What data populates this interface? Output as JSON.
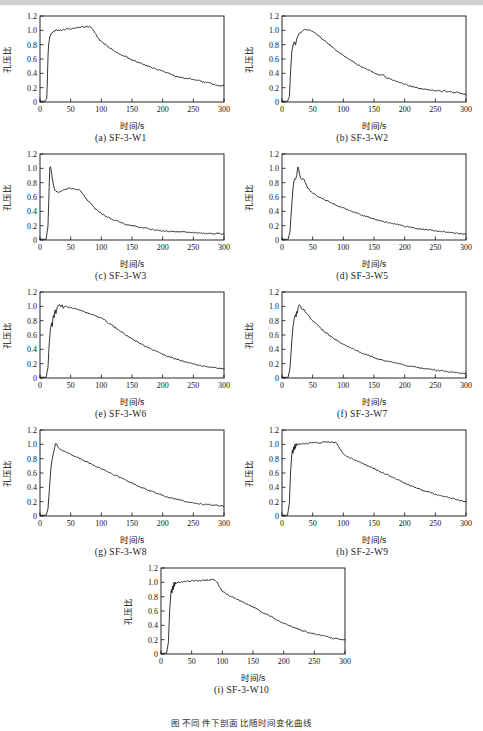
{
  "figure": {
    "caption": "图    不同       件下剖面            比随时间变化曲线",
    "axis": {
      "xlabel": "时间/s",
      "ylabel": "孔压比",
      "xticks": [
        0,
        50,
        100,
        150,
        200,
        250,
        300
      ],
      "yticks": [
        "0",
        "0.2",
        "0.4",
        "0.6",
        "0.8",
        "1.0",
        "1.2"
      ],
      "xlim": [
        0,
        300
      ],
      "ylim": [
        0,
        1.2
      ],
      "grid": false,
      "line_color": "#111111"
    }
  },
  "chart_data": [
    {
      "type": "line",
      "panel": "a",
      "title": "(a) SF-3-W1",
      "xlabel": "时间/s",
      "ylabel": "孔压比",
      "xlim": [
        0,
        300
      ],
      "ylim": [
        0,
        1.2
      ],
      "x": [
        0,
        8,
        11,
        12,
        13,
        14,
        16,
        18,
        20,
        23,
        26,
        30,
        35,
        40,
        45,
        50,
        55,
        60,
        65,
        70,
        75,
        80,
        84,
        88,
        92,
        96,
        100,
        110,
        120,
        130,
        140,
        150,
        160,
        170,
        180,
        190,
        200,
        210,
        215,
        220,
        230,
        240,
        250,
        260,
        265,
        270,
        275,
        280,
        285,
        290,
        295,
        300
      ],
      "y": [
        0.01,
        0.01,
        0.05,
        0.3,
        0.62,
        0.8,
        0.9,
        0.95,
        0.97,
        0.99,
        1.0,
        1.0,
        1.0,
        1.01,
        1.02,
        1.02,
        1.03,
        1.04,
        1.04,
        1.05,
        1.05,
        1.05,
        1.04,
        0.99,
        0.93,
        0.88,
        0.84,
        0.78,
        0.72,
        0.67,
        0.63,
        0.59,
        0.55,
        0.52,
        0.49,
        0.46,
        0.43,
        0.4,
        0.39,
        0.36,
        0.34,
        0.33,
        0.31,
        0.3,
        0.28,
        0.27,
        0.27,
        0.26,
        0.24,
        0.23,
        0.22,
        0.24
      ]
    },
    {
      "type": "line",
      "panel": "b",
      "title": "(b) SF-3-W2",
      "xlabel": "时间/s",
      "ylabel": "孔压比",
      "xlim": [
        0,
        300
      ],
      "ylim": [
        0,
        1.2
      ],
      "x": [
        0,
        9,
        12,
        14,
        16,
        18,
        20,
        22,
        24,
        26,
        28,
        30,
        34,
        38,
        42,
        46,
        50,
        55,
        60,
        70,
        80,
        90,
        100,
        110,
        120,
        130,
        140,
        150,
        160,
        165,
        170,
        180,
        190,
        200,
        210,
        220,
        230,
        240,
        250,
        260,
        265,
        270,
        275,
        280,
        285,
        290,
        295,
        300
      ],
      "y": [
        0.01,
        0.01,
        0.08,
        0.42,
        0.7,
        0.8,
        0.84,
        0.8,
        0.88,
        0.92,
        0.95,
        0.96,
        0.99,
        1.01,
        1.01,
        1.0,
        0.98,
        0.95,
        0.92,
        0.85,
        0.78,
        0.71,
        0.65,
        0.59,
        0.54,
        0.49,
        0.45,
        0.41,
        0.37,
        0.38,
        0.34,
        0.31,
        0.28,
        0.25,
        0.22,
        0.2,
        0.18,
        0.17,
        0.16,
        0.15,
        0.16,
        0.14,
        0.15,
        0.13,
        0.14,
        0.12,
        0.12,
        0.1
      ]
    },
    {
      "type": "line",
      "panel": "c",
      "title": "(c) SF-3-W3",
      "xlabel": "时间/s",
      "ylabel": "孔压比",
      "xlim": [
        0,
        300
      ],
      "ylim": [
        0,
        1.2
      ],
      "x": [
        0,
        10,
        13,
        15,
        16,
        17,
        18,
        19,
        20,
        22,
        24,
        26,
        28,
        30,
        34,
        38,
        42,
        46,
        50,
        55,
        60,
        64,
        66,
        70,
        75,
        80,
        90,
        100,
        110,
        120,
        130,
        140,
        150,
        160,
        170,
        180,
        190,
        200,
        210,
        220,
        230,
        240,
        250,
        260,
        270,
        280,
        290,
        300
      ],
      "y": [
        0.01,
        0.01,
        0.2,
        0.75,
        1.0,
        1.02,
        0.98,
        0.92,
        0.85,
        0.76,
        0.7,
        0.68,
        0.68,
        0.67,
        0.68,
        0.7,
        0.71,
        0.72,
        0.72,
        0.71,
        0.7,
        0.7,
        0.69,
        0.64,
        0.58,
        0.53,
        0.44,
        0.37,
        0.32,
        0.28,
        0.25,
        0.22,
        0.2,
        0.18,
        0.17,
        0.15,
        0.14,
        0.13,
        0.12,
        0.12,
        0.11,
        0.11,
        0.1,
        0.1,
        0.09,
        0.09,
        0.09,
        0.08
      ]
    },
    {
      "type": "line",
      "panel": "d",
      "title": "(d) SF-3-W5",
      "xlabel": "时间/s",
      "ylabel": "孔压比",
      "xlim": [
        0,
        300
      ],
      "ylim": [
        0,
        1.2
      ],
      "x": [
        0,
        10,
        13,
        16,
        18,
        20,
        22,
        24,
        25,
        26,
        27,
        28,
        30,
        32,
        34,
        36,
        38,
        40,
        42,
        45,
        50,
        55,
        60,
        65,
        70,
        80,
        90,
        100,
        110,
        120,
        130,
        140,
        150,
        160,
        170,
        180,
        190,
        200,
        210,
        220,
        230,
        240,
        250,
        260,
        270,
        280,
        290,
        300
      ],
      "y": [
        0.01,
        0.01,
        0.12,
        0.5,
        0.72,
        0.84,
        0.85,
        0.9,
        0.98,
        1.02,
        1.0,
        0.94,
        0.86,
        0.84,
        0.86,
        0.85,
        0.8,
        0.76,
        0.73,
        0.7,
        0.66,
        0.63,
        0.6,
        0.58,
        0.56,
        0.52,
        0.48,
        0.45,
        0.41,
        0.38,
        0.35,
        0.32,
        0.29,
        0.27,
        0.25,
        0.23,
        0.21,
        0.19,
        0.18,
        0.16,
        0.15,
        0.14,
        0.13,
        0.12,
        0.11,
        0.1,
        0.09,
        0.08
      ]
    },
    {
      "type": "line",
      "panel": "e",
      "title": "(e) SF-3-W6",
      "xlabel": "时间/s",
      "ylabel": "孔压比",
      "xlim": [
        0,
        300
      ],
      "ylim": [
        0,
        1.2
      ],
      "x": [
        0,
        10,
        13,
        15,
        17,
        19,
        20,
        21,
        22,
        23,
        24,
        25,
        26,
        28,
        30,
        32,
        34,
        36,
        38,
        40,
        45,
        50,
        55,
        60,
        70,
        80,
        90,
        100,
        110,
        120,
        130,
        140,
        150,
        160,
        170,
        180,
        190,
        200,
        210,
        220,
        230,
        240,
        250,
        260,
        270,
        280,
        290,
        300
      ],
      "y": [
        0.01,
        0.01,
        0.15,
        0.48,
        0.68,
        0.78,
        0.72,
        0.82,
        0.88,
        0.84,
        0.92,
        0.95,
        0.9,
        0.98,
        1.01,
        1.02,
        1.0,
        1.02,
        0.98,
        1.0,
        0.99,
        0.98,
        0.97,
        0.96,
        0.93,
        0.9,
        0.87,
        0.84,
        0.78,
        0.72,
        0.66,
        0.6,
        0.55,
        0.5,
        0.45,
        0.41,
        0.37,
        0.33,
        0.3,
        0.27,
        0.24,
        0.22,
        0.2,
        0.18,
        0.16,
        0.15,
        0.13,
        0.13
      ]
    },
    {
      "type": "line",
      "panel": "f",
      "title": "(f) SF-3-W7",
      "xlabel": "时间/s",
      "ylabel": "孔压比",
      "xlim": [
        0,
        300
      ],
      "ylim": [
        0,
        1.2
      ],
      "x": [
        0,
        10,
        13,
        16,
        18,
        20,
        22,
        23,
        24,
        25,
        26,
        27,
        28,
        30,
        32,
        34,
        36,
        38,
        40,
        45,
        50,
        55,
        60,
        65,
        70,
        80,
        90,
        100,
        110,
        120,
        130,
        140,
        150,
        160,
        170,
        180,
        190,
        200,
        210,
        220,
        230,
        240,
        250,
        260,
        270,
        280,
        290,
        300
      ],
      "y": [
        0.01,
        0.01,
        0.14,
        0.52,
        0.72,
        0.84,
        0.88,
        0.86,
        0.92,
        0.9,
        0.96,
        1.0,
        1.03,
        1.0,
        0.97,
        0.95,
        0.96,
        0.93,
        0.9,
        0.85,
        0.8,
        0.76,
        0.72,
        0.68,
        0.64,
        0.58,
        0.52,
        0.47,
        0.43,
        0.39,
        0.35,
        0.32,
        0.29,
        0.26,
        0.24,
        0.22,
        0.2,
        0.18,
        0.16,
        0.15,
        0.13,
        0.12,
        0.11,
        0.1,
        0.09,
        0.08,
        0.07,
        0.06
      ]
    },
    {
      "type": "line",
      "panel": "g",
      "title": "(g) SF-3-W8",
      "xlabel": "时间/s",
      "ylabel": "孔压比",
      "xlim": [
        0,
        300
      ],
      "ylim": [
        0,
        1.2
      ],
      "x": [
        0,
        10,
        13,
        16,
        18,
        20,
        22,
        24,
        25,
        26,
        27,
        28,
        30,
        33,
        36,
        40,
        45,
        50,
        55,
        60,
        70,
        80,
        90,
        100,
        110,
        120,
        130,
        140,
        150,
        160,
        170,
        180,
        190,
        200,
        210,
        220,
        230,
        240,
        250,
        260,
        270,
        275,
        280,
        285,
        290,
        295,
        300
      ],
      "y": [
        0.01,
        0.01,
        0.1,
        0.45,
        0.68,
        0.8,
        0.88,
        0.96,
        1.0,
        1.02,
        1.01,
        0.99,
        0.96,
        0.93,
        0.92,
        0.9,
        0.88,
        0.86,
        0.84,
        0.82,
        0.78,
        0.74,
        0.7,
        0.66,
        0.62,
        0.58,
        0.54,
        0.5,
        0.46,
        0.42,
        0.38,
        0.35,
        0.32,
        0.29,
        0.26,
        0.24,
        0.22,
        0.2,
        0.18,
        0.17,
        0.16,
        0.17,
        0.15,
        0.16,
        0.14,
        0.14,
        0.13
      ]
    },
    {
      "type": "line",
      "panel": "h",
      "title": "(h) SF-2-W9",
      "xlabel": "时间/s",
      "ylabel": "孔压比",
      "xlim": [
        0,
        300
      ],
      "ylim": [
        0,
        1.2
      ],
      "x": [
        0,
        9,
        12,
        14,
        16,
        17,
        18,
        19,
        20,
        21,
        22,
        23,
        24,
        26,
        28,
        30,
        35,
        40,
        45,
        50,
        60,
        70,
        80,
        85,
        88,
        92,
        96,
        100,
        105,
        110,
        120,
        130,
        140,
        150,
        160,
        170,
        180,
        190,
        200,
        210,
        220,
        230,
        240,
        250,
        260,
        270,
        275,
        280,
        285,
        290,
        295,
        300
      ],
      "y": [
        0.01,
        0.01,
        0.18,
        0.62,
        0.85,
        0.92,
        0.88,
        0.96,
        0.92,
        1.0,
        0.95,
        1.02,
        0.98,
        1.0,
        1.0,
        1.0,
        1.01,
        1.01,
        1.02,
        1.02,
        1.02,
        1.03,
        1.03,
        1.03,
        1.02,
        0.98,
        0.92,
        0.87,
        0.84,
        0.82,
        0.78,
        0.74,
        0.7,
        0.66,
        0.62,
        0.58,
        0.54,
        0.5,
        0.46,
        0.42,
        0.39,
        0.36,
        0.33,
        0.3,
        0.28,
        0.26,
        0.25,
        0.24,
        0.23,
        0.22,
        0.21,
        0.2
      ]
    },
    {
      "type": "line",
      "panel": "i",
      "title": "(i) SF-3-W10",
      "xlabel": "时间/s",
      "ylabel": "孔压比",
      "xlim": [
        0,
        300
      ],
      "ylim": [
        0,
        1.2
      ],
      "x": [
        0,
        9,
        12,
        14,
        16,
        17,
        18,
        19,
        20,
        21,
        22,
        23,
        24,
        26,
        28,
        30,
        35,
        40,
        45,
        50,
        60,
        70,
        80,
        85,
        88,
        92,
        96,
        100,
        105,
        110,
        120,
        130,
        140,
        150,
        160,
        170,
        180,
        190,
        200,
        210,
        220,
        230,
        240,
        250,
        260,
        270,
        275,
        280,
        285,
        290,
        295,
        300
      ],
      "y": [
        0.01,
        0.01,
        0.16,
        0.58,
        0.84,
        0.9,
        0.86,
        0.95,
        0.9,
        1.0,
        0.94,
        1.01,
        0.97,
        0.99,
        1.0,
        1.0,
        1.01,
        1.01,
        1.02,
        1.02,
        1.02,
        1.03,
        1.03,
        1.04,
        1.03,
        0.99,
        0.93,
        0.88,
        0.85,
        0.82,
        0.78,
        0.74,
        0.7,
        0.66,
        0.61,
        0.56,
        0.52,
        0.47,
        0.43,
        0.39,
        0.36,
        0.33,
        0.3,
        0.28,
        0.26,
        0.24,
        0.23,
        0.22,
        0.22,
        0.21,
        0.2,
        0.2
      ]
    }
  ]
}
